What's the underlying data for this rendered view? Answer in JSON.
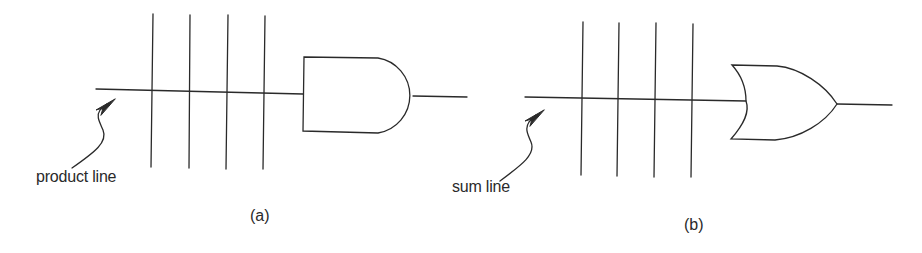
{
  "panels": [
    {
      "id": "a",
      "caption": "(a)",
      "line_label": "product line",
      "gate_type": "AND",
      "input_columns": 4
    },
    {
      "id": "b",
      "caption": "(b)",
      "line_label": "sum line",
      "gate_type": "OR",
      "input_columns": 4
    }
  ],
  "colors": {
    "stroke": "#2a2a2a",
    "background": "#ffffff"
  }
}
